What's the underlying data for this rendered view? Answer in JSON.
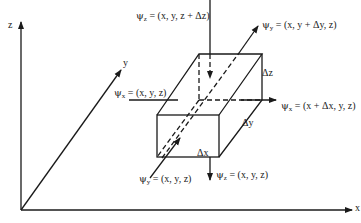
{
  "diagram": {
    "axes": {
      "x": "x",
      "y": "y",
      "z": "z"
    },
    "box_dimensions": {
      "dx": "Δx",
      "dy": "Δy",
      "dz": "Δz"
    },
    "fluxes": {
      "psi_z_top": {
        "symbol": "ψ",
        "sub": "z",
        "expr": "= (x, y, z + Δz)"
      },
      "psi_y_back": {
        "symbol": "ψ",
        "sub": "y",
        "expr": "= (x, y + Δy, z)"
      },
      "psi_x_left": {
        "symbol": "ψ",
        "sub": "x",
        "expr": "= (x, y, z)"
      },
      "psi_x_right": {
        "symbol": "ψ",
        "sub": "x",
        "expr": "= (x + Δx, y, z)"
      },
      "psi_y_front": {
        "symbol": "ψ",
        "sub": "y",
        "expr": "= (x, y, z)"
      },
      "psi_z_bottom": {
        "symbol": "ψ",
        "sub": "z",
        "expr": "= (x, y, z)"
      }
    },
    "colors": {
      "line": "#1a1a1a",
      "background": "#ffffff"
    }
  }
}
